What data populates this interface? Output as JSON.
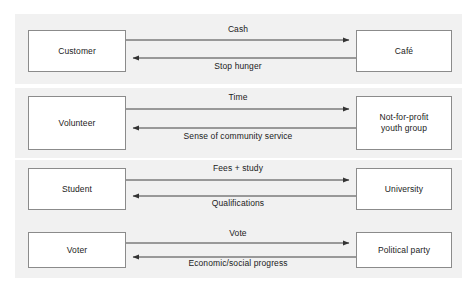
{
  "diagram": {
    "type": "exchange-relationship-diagram",
    "colors": {
      "panel_background": "#f1f1f1",
      "page_background": "#ffffff",
      "node_border": "#8b8b8b",
      "node_fill": "#ffffff",
      "arrow": "#404040",
      "text": "#1b1b1b"
    },
    "rows": [
      {
        "id": "customer-cafe",
        "left_node": "Customer",
        "right_node": "Café",
        "forward_label": "Cash",
        "return_label": "Stop hunger"
      },
      {
        "id": "volunteer-youth-group",
        "left_node": "Volunteer",
        "right_node": "Not-for-profit\nyouth group",
        "forward_label": "Time",
        "return_label": "Sense of community service"
      },
      {
        "id": "student-university",
        "left_node": "Student",
        "right_node": "University",
        "forward_label": "Fees + study",
        "return_label": "Qualifications"
      },
      {
        "id": "voter-political-party",
        "left_node": "Voter",
        "right_node": "Political party",
        "forward_label": "Vote",
        "return_label": "Economic/social progress"
      }
    ]
  }
}
